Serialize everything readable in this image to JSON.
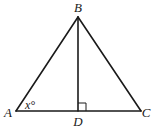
{
  "diagram": {
    "type": "triangle-with-altitude",
    "colors": {
      "stroke": "#1a1a1a",
      "background": "#ffffff"
    },
    "points": {
      "A": {
        "label": "A",
        "x": 16,
        "y": 111
      },
      "B": {
        "label": "B",
        "x": 78,
        "y": 17
      },
      "C": {
        "label": "C",
        "x": 141,
        "y": 111
      },
      "D": {
        "label": "D",
        "x": 78,
        "y": 111
      }
    },
    "segments": [
      {
        "from": "A",
        "to": "B"
      },
      {
        "from": "B",
        "to": "C"
      },
      {
        "from": "A",
        "to": "C"
      },
      {
        "from": "B",
        "to": "D"
      }
    ],
    "angle_label": {
      "vertex": "A",
      "text": "x°"
    },
    "right_angle_marker": {
      "vertex": "D",
      "size": 8
    }
  }
}
